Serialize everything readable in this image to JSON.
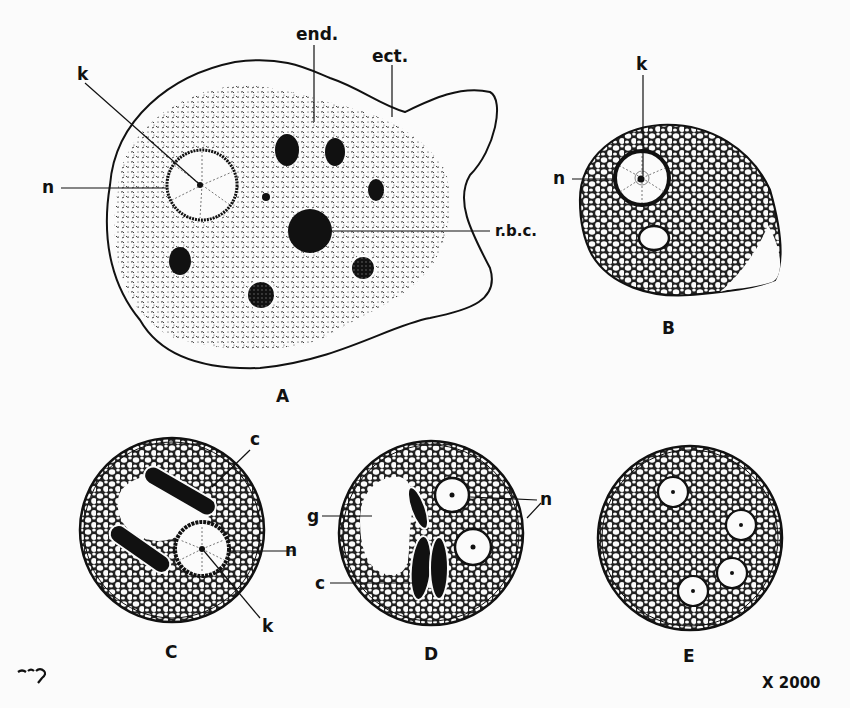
{
  "figure": {
    "magnification": "X 2000",
    "signature": "C.L.B.G.",
    "colors": {
      "ink": "#111111",
      "paper": "#fbfbfb"
    }
  },
  "panels": {
    "A": {
      "label": "A",
      "annotations": {
        "k": "k",
        "n": "n",
        "end": "end.",
        "ect": "ect.",
        "rbc": "r.b.c."
      }
    },
    "B": {
      "label": "B",
      "annotations": {
        "k": "k",
        "n": "n"
      }
    },
    "C": {
      "label": "C",
      "annotations": {
        "c": "c",
        "n": "n",
        "k": "k"
      }
    },
    "D": {
      "label": "D",
      "annotations": {
        "g": "g",
        "c": "c",
        "n": "n"
      }
    },
    "E": {
      "label": "E",
      "annotations": {}
    }
  }
}
